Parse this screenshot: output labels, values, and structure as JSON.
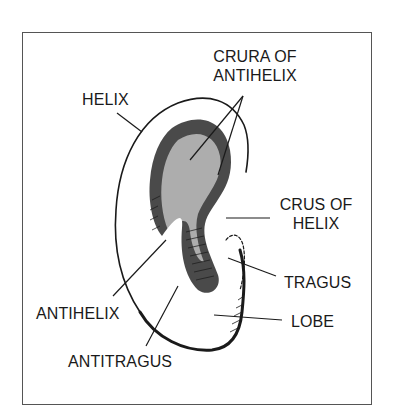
{
  "diagram": {
    "style": {
      "line_color": "#1a1a1a",
      "frame_color": "#555555",
      "background": "#ffffff"
    },
    "labels": {
      "helix": "HELIX",
      "crura_line1": "CRURA OF",
      "crura_line2": "ANTIHELIX",
      "crus_line1": "CRUS OF",
      "crus_line2": "HELIX",
      "tragus": "TRAGUS",
      "lobe": "LOBE",
      "antihelix": "ANTIHELIX",
      "antitragus": "ANTITRAGUS"
    }
  }
}
